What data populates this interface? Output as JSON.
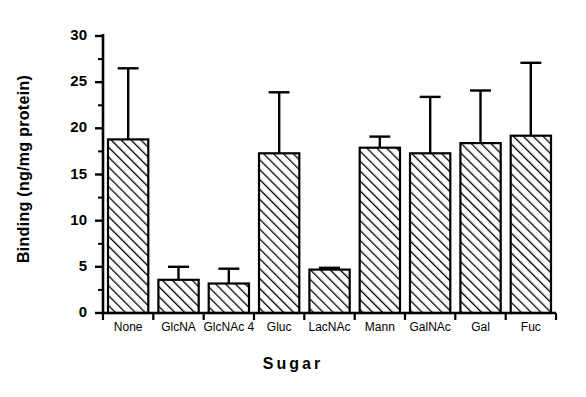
{
  "chart_data": {
    "type": "bar",
    "title": "",
    "xlabel": "Sugar",
    "ylabel": "Binding (ng/mg protein)",
    "categories": [
      "None",
      "GlcNA",
      "GlcNAc 4",
      "Gluc",
      "LacNAc",
      "Mann",
      "GalNAc",
      "Gal",
      "Fuc"
    ],
    "values": [
      18.8,
      3.6,
      3.2,
      17.3,
      4.7,
      17.9,
      17.3,
      18.4,
      19.2
    ],
    "errors_upper": [
      26.5,
      5.0,
      4.8,
      23.9,
      4.9,
      19.1,
      23.4,
      24.1,
      27.1
    ],
    "ylim": [
      0,
      30
    ],
    "yticks": [
      0,
      5,
      10,
      15,
      20,
      25,
      30
    ],
    "ytick_labels": [
      "0",
      "5",
      "10",
      "15",
      "20",
      "25",
      "30"
    ],
    "minor_ticks": true,
    "grid": false,
    "legend": null,
    "bar_fill": "hatch-diagonal",
    "bar_color": "#000000",
    "error_bar_style": "upper-only-capped"
  }
}
